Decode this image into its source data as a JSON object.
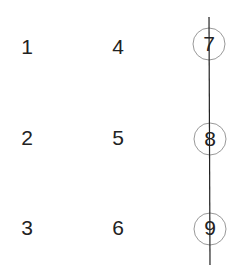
{
  "diagram": {
    "grid": [
      {
        "label": "1",
        "x": 27,
        "y": 48,
        "circled": false
      },
      {
        "label": "2",
        "x": 27,
        "y": 139,
        "circled": false
      },
      {
        "label": "3",
        "x": 27,
        "y": 229,
        "circled": false
      },
      {
        "label": "4",
        "x": 118,
        "y": 48,
        "circled": false
      },
      {
        "label": "5",
        "x": 118,
        "y": 139,
        "circled": false
      },
      {
        "label": "6",
        "x": 118,
        "y": 229,
        "circled": false
      },
      {
        "label": "7",
        "x": 209,
        "y": 48,
        "circled": true
      },
      {
        "label": "8",
        "x": 210,
        "y": 139,
        "circled": true
      },
      {
        "label": "9",
        "x": 210,
        "y": 229,
        "circled": true
      }
    ],
    "line": {
      "x1": 209,
      "y1": 17,
      "x2": 210,
      "y2": 265
    },
    "circle_radius": 16,
    "colors": {
      "digit": "#222222",
      "line": "#222222",
      "circle": "#999999"
    }
  }
}
